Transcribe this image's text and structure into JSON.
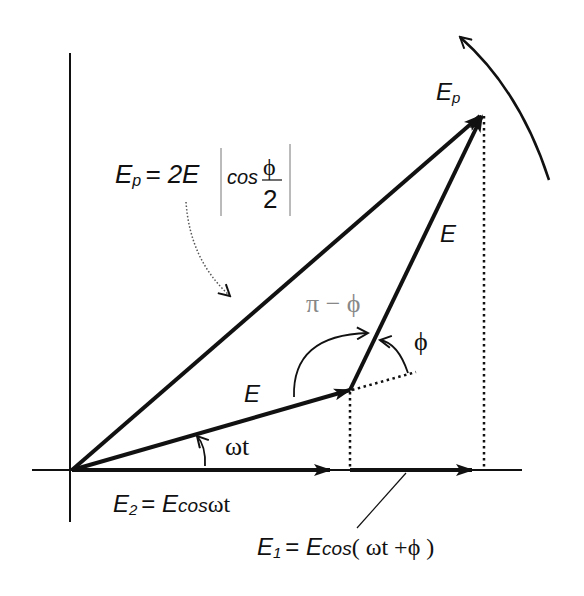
{
  "diagram": {
    "type": "phasor-diagram",
    "colors": {
      "stroke": "#111111",
      "muted_label": "#888888",
      "background": "#ffffff"
    },
    "labels": {
      "ep_top": {
        "main": "E",
        "sub": "p"
      },
      "formula": {
        "lhs_main": "E",
        "lhs_sub": "p",
        "eq": "= 2E",
        "cos": "cos",
        "num": "ϕ",
        "den": "2"
      },
      "e_right": "E",
      "e_lower": "E",
      "pi_minus_phi": "π − ϕ",
      "phi": "ϕ",
      "omega_t": "ωt",
      "e2_eq": {
        "main": "E",
        "sub": "2",
        "rest": "= ",
        "ecos": "E",
        "cos": "cos",
        "arg": "ωt"
      },
      "e1_eq": {
        "main": "E",
        "sub": "1",
        "rest": "= ",
        "ecos": "E",
        "cos": "cos",
        "arg": "( ωt +ϕ )"
      }
    },
    "vectors": [
      {
        "name": "E",
        "from": [
          72,
          470
        ],
        "to": [
          350,
          390
        ]
      },
      {
        "name": "E (second)",
        "from": [
          350,
          390
        ],
        "to": [
          484,
          112
        ]
      },
      {
        "name": "Ep",
        "from": [
          72,
          470
        ],
        "to": [
          484,
          112
        ]
      },
      {
        "name": "E2 projection",
        "from": [
          72,
          470
        ],
        "to": [
          330,
          470
        ]
      },
      {
        "name": "E1 projection",
        "from": [
          350,
          470
        ],
        "to": [
          472,
          470
        ]
      }
    ]
  }
}
